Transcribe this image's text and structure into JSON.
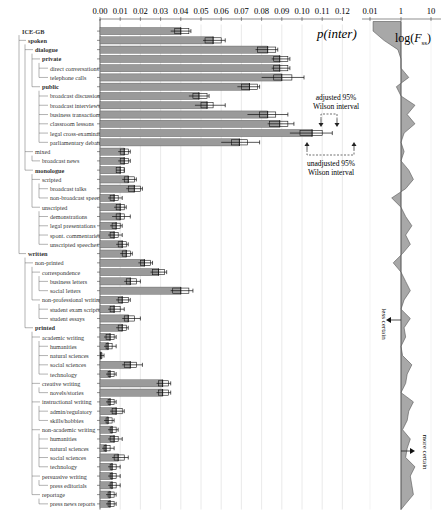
{
  "chart_data": {
    "type": "bar",
    "orientation": "horizontal",
    "title": "p(inter)",
    "xlabel": "",
    "ylabel": "",
    "xlim": [
      0,
      0.12
    ],
    "x_ticks": [
      "0.00",
      "0.01",
      "0.02",
      "0.03",
      "0.04",
      "0.05",
      "0.06",
      "0.07",
      "0.08",
      "0.09",
      "0.10",
      "0.11",
      "0.12"
    ],
    "grid": true,
    "categories": [
      {
        "label": "ICE-GB",
        "depth": 0,
        "bold": true
      },
      {
        "label": "spoken",
        "depth": 1,
        "bold": true
      },
      {
        "label": "dialogue",
        "depth": 2,
        "bold": true
      },
      {
        "label": "private",
        "depth": 3,
        "bold": true
      },
      {
        "label": "direct conversations",
        "depth": 4,
        "bold": false
      },
      {
        "label": "telephone calls",
        "depth": 4,
        "bold": false
      },
      {
        "label": "public",
        "depth": 3,
        "bold": true
      },
      {
        "label": "broadcast discussions",
        "depth": 4,
        "bold": false
      },
      {
        "label": "broadcast interviews",
        "depth": 4,
        "bold": false
      },
      {
        "label": "business transactions",
        "depth": 4,
        "bold": false
      },
      {
        "label": "classroom lessons",
        "depth": 4,
        "bold": false
      },
      {
        "label": "legal cross-examinations",
        "depth": 4,
        "bold": false
      },
      {
        "label": "parliamentary debates",
        "depth": 4,
        "bold": false
      },
      {
        "label": "mixed",
        "depth": 2,
        "bold": false
      },
      {
        "label": "broadcast news",
        "depth": 3,
        "bold": false
      },
      {
        "label": "monologue",
        "depth": 2,
        "bold": true
      },
      {
        "label": "scripted",
        "depth": 3,
        "bold": false
      },
      {
        "label": "broadcast talks",
        "depth": 4,
        "bold": false
      },
      {
        "label": "non-broadcast speeches",
        "depth": 4,
        "bold": false
      },
      {
        "label": "unscripted",
        "depth": 3,
        "bold": false
      },
      {
        "label": "demonstrations",
        "depth": 4,
        "bold": false
      },
      {
        "label": "legal presentations",
        "depth": 4,
        "bold": false
      },
      {
        "label": "spont. commentaries",
        "depth": 4,
        "bold": false
      },
      {
        "label": "unscripted speeches",
        "depth": 4,
        "bold": false
      },
      {
        "label": "written",
        "depth": 1,
        "bold": true
      },
      {
        "label": "non-printed",
        "depth": 2,
        "bold": false
      },
      {
        "label": "correspondence",
        "depth": 3,
        "bold": false
      },
      {
        "label": "business letters",
        "depth": 4,
        "bold": false
      },
      {
        "label": "social letters",
        "depth": 4,
        "bold": false
      },
      {
        "label": "non-professional writing",
        "depth": 3,
        "bold": false
      },
      {
        "label": "student exam scripts",
        "depth": 4,
        "bold": false
      },
      {
        "label": "student essays",
        "depth": 4,
        "bold": false
      },
      {
        "label": "printed",
        "depth": 2,
        "bold": true
      },
      {
        "label": "academic writing",
        "depth": 3,
        "bold": false
      },
      {
        "label": "humanities",
        "depth": 4,
        "bold": false
      },
      {
        "label": "natural sciences",
        "depth": 4,
        "bold": false
      },
      {
        "label": "social sciences",
        "depth": 4,
        "bold": false
      },
      {
        "label": "technology",
        "depth": 4,
        "bold": false
      },
      {
        "label": "creative writing",
        "depth": 3,
        "bold": false
      },
      {
        "label": "novels/stories",
        "depth": 4,
        "bold": false
      },
      {
        "label": "instructional writing",
        "depth": 3,
        "bold": false
      },
      {
        "label": "admin/regulatory",
        "depth": 4,
        "bold": false
      },
      {
        "label": "skills/hobbies",
        "depth": 4,
        "bold": false
      },
      {
        "label": "non-academic writing",
        "depth": 3,
        "bold": false
      },
      {
        "label": "humanities",
        "depth": 4,
        "bold": false
      },
      {
        "label": "natural sciences",
        "depth": 4,
        "bold": false
      },
      {
        "label": "social sciences",
        "depth": 4,
        "bold": false
      },
      {
        "label": "technology",
        "depth": 4,
        "bold": false
      },
      {
        "label": "persuasive writing",
        "depth": 3,
        "bold": false
      },
      {
        "label": "press editorials",
        "depth": 4,
        "bold": false
      },
      {
        "label": "reportage",
        "depth": 3,
        "bold": false
      },
      {
        "label": "press news reports",
        "depth": 4,
        "bold": false
      }
    ],
    "series": [
      {
        "name": "p(inter)",
        "values": [
          0.04,
          0.056,
          0.083,
          0.089,
          0.089,
          0.09,
          0.074,
          0.049,
          0.053,
          0.083,
          0.089,
          0.105,
          0.069,
          0.012,
          0.012,
          0.01,
          0.014,
          0.017,
          0.007,
          0.01,
          0.01,
          0.008,
          0.007,
          0.011,
          0.013,
          0.022,
          0.029,
          0.015,
          0.04,
          0.011,
          0.007,
          0.014,
          0.011,
          0.005,
          0.004,
          0.0005,
          0.015,
          0.005,
          0.031,
          0.031,
          0.005,
          0.008,
          0.004,
          0.006,
          0.007,
          0.003,
          0.009,
          0.006,
          0.006,
          0.006,
          0.005,
          0.005
        ]
      },
      {
        "name": "adjusted 95% Wilson interval",
        "lower": [
          0.037,
          0.052,
          0.078,
          0.086,
          0.086,
          0.086,
          0.07,
          0.046,
          0.05,
          0.079,
          0.084,
          0.099,
          0.065,
          0.01,
          0.01,
          0.008,
          0.012,
          0.014,
          0.005,
          0.008,
          0.008,
          0.006,
          0.005,
          0.009,
          0.011,
          0.02,
          0.026,
          0.013,
          0.036,
          0.009,
          0.005,
          0.012,
          0.009,
          0.003,
          0.003,
          0.0002,
          0.012,
          0.004,
          0.029,
          0.029,
          0.004,
          0.006,
          0.003,
          0.005,
          0.005,
          0.002,
          0.007,
          0.005,
          0.005,
          0.005,
          0.004,
          0.004
        ],
        "upper": [
          0.044,
          0.06,
          0.087,
          0.093,
          0.093,
          0.095,
          0.078,
          0.053,
          0.056,
          0.087,
          0.093,
          0.11,
          0.073,
          0.014,
          0.014,
          0.012,
          0.017,
          0.02,
          0.009,
          0.012,
          0.012,
          0.01,
          0.009,
          0.013,
          0.015,
          0.025,
          0.032,
          0.018,
          0.044,
          0.014,
          0.01,
          0.017,
          0.013,
          0.007,
          0.006,
          0.001,
          0.018,
          0.007,
          0.034,
          0.034,
          0.007,
          0.011,
          0.006,
          0.008,
          0.009,
          0.005,
          0.012,
          0.008,
          0.008,
          0.008,
          0.007,
          0.007
        ]
      },
      {
        "name": "unadjusted 95% Wilson interval",
        "lower": [
          0.035,
          0.051,
          0.077,
          0.085,
          0.085,
          0.08,
          0.068,
          0.044,
          0.047,
          0.073,
          0.083,
          0.094,
          0.06,
          0.009,
          0.009,
          0.008,
          0.011,
          0.013,
          0.004,
          0.007,
          0.006,
          0.005,
          0.004,
          0.008,
          0.01,
          0.019,
          0.025,
          0.012,
          0.035,
          0.008,
          0.004,
          0.011,
          0.008,
          0.002,
          0.002,
          0.0001,
          0.011,
          0.003,
          0.028,
          0.028,
          0.003,
          0.005,
          0.002,
          0.004,
          0.004,
          0.001,
          0.006,
          0.004,
          0.004,
          0.004,
          0.003,
          0.003
        ],
        "upper": [
          0.045,
          0.062,
          0.088,
          0.094,
          0.094,
          0.101,
          0.079,
          0.054,
          0.062,
          0.093,
          0.096,
          0.115,
          0.079,
          0.015,
          0.015,
          0.012,
          0.018,
          0.021,
          0.011,
          0.013,
          0.015,
          0.011,
          0.011,
          0.014,
          0.016,
          0.026,
          0.033,
          0.02,
          0.046,
          0.015,
          0.012,
          0.02,
          0.014,
          0.008,
          0.008,
          0.002,
          0.021,
          0.008,
          0.035,
          0.035,
          0.008,
          0.012,
          0.007,
          0.009,
          0.011,
          0.007,
          0.014,
          0.01,
          0.01,
          0.01,
          0.008,
          0.008
        ]
      }
    ],
    "side_panel": {
      "title": "log(F_ss)",
      "type": "area",
      "x_ticks": [
        "0.01",
        "1",
        "10"
      ],
      "annotations": [
        "less certain",
        "more certain"
      ]
    },
    "annotations": [
      "adjusted 95% Wilson interval",
      "unadjusted 95% Wilson interval"
    ]
  },
  "labels": {
    "main_title": "p(inter)",
    "side_title_prefix": "log(",
    "side_title_var": "F",
    "side_title_sub": "ss",
    "side_title_suffix": ")",
    "adjusted_line1": "adjusted 95%",
    "adjusted_line2": "Wilson interval",
    "unadjusted_line1": "unadjusted 95%",
    "unadjusted_line2": "Wilson interval",
    "less_certain": "less certain",
    "more_certain": "more certain"
  },
  "colors": {
    "bar_fill": "#9a9a9a",
    "bar_stroke": "#555555",
    "grid": "#e4e4e4",
    "area_fill": "#a8a8a8",
    "text": "#222222"
  },
  "fss_profile": [
    -1.8,
    -1.1,
    -0.2,
    0.0,
    0.0,
    0.5,
    -0.3,
    0.0,
    0.9,
    0.4,
    0.9,
    0.2,
    0.0,
    0.2,
    0.0,
    0.5,
    0.8,
    0.3,
    -0.6,
    0.0,
    0.3,
    0.7,
    0.3,
    0.6,
    0.1,
    -0.5,
    0.0,
    0.3,
    0.6,
    0.2,
    0.0,
    0.6,
    0.2,
    0.3,
    0.0,
    0.1,
    0.7,
    0.4,
    0.3,
    0.0,
    0.8,
    0.5,
    0.4,
    0.1,
    0.6,
    0.4,
    0.3,
    0.9,
    0.6,
    0.7,
    0.8,
    0.3
  ]
}
